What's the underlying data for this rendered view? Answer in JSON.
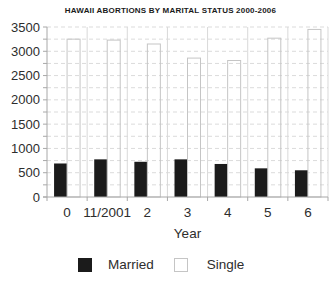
{
  "chart_data": {
    "type": "bar",
    "title": "HAWAII ABORTIONS BY MARITAL STATUS 2000-2006",
    "xlabel": "Year",
    "ylabel": "",
    "categories": [
      "0",
      "11/2001",
      "2",
      "3",
      "4",
      "5",
      "6"
    ],
    "series": [
      {
        "name": "Married",
        "color": "#1b1b1b",
        "border": "#000000",
        "values": [
          690,
          775,
          725,
          775,
          680,
          590,
          550
        ]
      },
      {
        "name": "Single",
        "color": "transparent",
        "border": "#c5c5c5",
        "values": [
          3250,
          3230,
          3150,
          2860,
          2810,
          3270,
          3450
        ]
      }
    ],
    "ylim": [
      0,
      3500
    ],
    "ytick_step": 500,
    "minor_step": 250,
    "grid": true,
    "gridline_color": "#dbdbdb",
    "vgridline_color": "#d9d9d9",
    "axis_color": "#a8a8a8",
    "label_color": "#2d2d2d",
    "legend_position": "bottom"
  }
}
